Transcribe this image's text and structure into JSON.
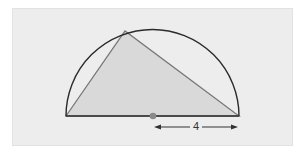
{
  "diagram": {
    "radius_label": "4",
    "colors": {
      "background": "#ededed",
      "triangle_fill": "#d9d9d9",
      "semicircle_stroke": "#2b2b2b",
      "triangle_stroke": "#777777",
      "center_dot": "#8a8a8a",
      "arrow": "#333333"
    }
  }
}
